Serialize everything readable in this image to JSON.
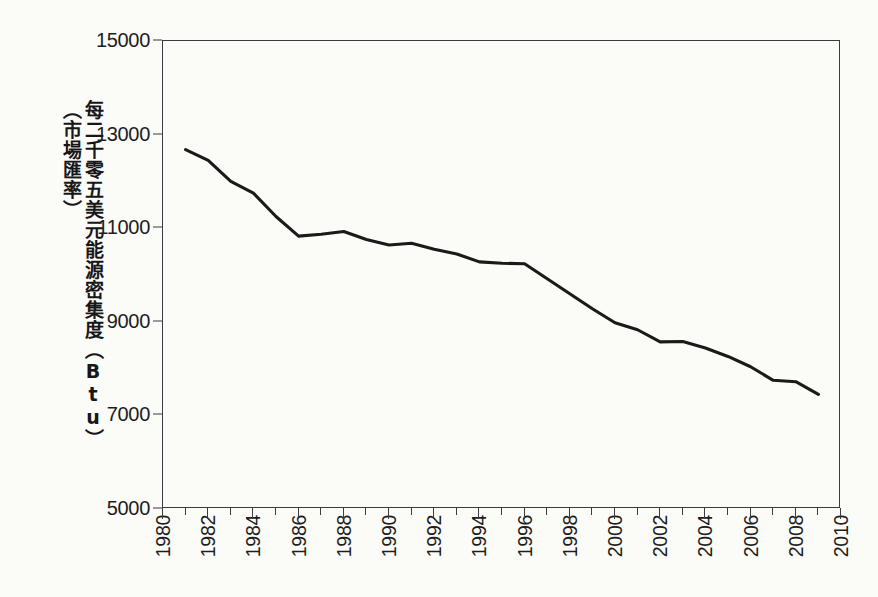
{
  "figure": {
    "background_color": "#fbfbf8",
    "axis_color": "#3b3b40",
    "line_color": "#1a1a1a"
  },
  "axis": {
    "ylabel_line1": "每二千零五美元能源密集度（Btu）",
    "ylabel_line2": "（市場匯率）",
    "yticks": [
      "5000",
      "7000",
      "9000",
      "11000",
      "13000",
      "15000"
    ],
    "xticks": [
      "1980",
      "1982",
      "1984",
      "1986",
      "1988",
      "1990",
      "1992",
      "1994",
      "1996",
      "1998",
      "2000",
      "2002",
      "2004",
      "2006",
      "2008",
      "2010"
    ]
  },
  "chart_data": {
    "type": "line",
    "title": "",
    "subtitle": "",
    "xlabel": "",
    "ylabel": "每二千零五美元能源密集度（Btu）（市場匯率）",
    "xlim": [
      1980,
      2010
    ],
    "ylim": [
      5000,
      15000
    ],
    "ytick_values": [
      5000,
      7000,
      9000,
      11000,
      13000,
      15000
    ],
    "xtick_values": [
      1980,
      1982,
      1984,
      1986,
      1988,
      1990,
      1992,
      1994,
      1996,
      1998,
      2000,
      2002,
      2004,
      2006,
      2008,
      2010
    ],
    "grid": false,
    "legend": false,
    "legend_position": "none",
    "x": [
      1981,
      1982,
      1983,
      1984,
      1985,
      1986,
      1987,
      1988,
      1989,
      1990,
      1991,
      1992,
      1993,
      1994,
      1995,
      1996,
      1997,
      1998,
      1999,
      2000,
      2001,
      2002,
      2003,
      2004,
      2005,
      2006,
      2007,
      2008,
      2009
    ],
    "series": [
      {
        "name": "能源密集度",
        "values": [
          12680,
          12450,
          12000,
          11750,
          11250,
          10830,
          10870,
          10930,
          10760,
          10640,
          10680,
          10550,
          10450,
          10280,
          10250,
          10240,
          9920,
          9600,
          9280,
          8980,
          8830,
          8570,
          8580,
          8440,
          8260,
          8040,
          7750,
          7720,
          7450
        ]
      }
    ]
  }
}
